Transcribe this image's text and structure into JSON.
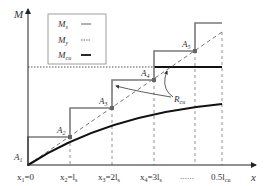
{
  "axes": {
    "y_label": "M",
    "x_label": "x"
  },
  "legend": {
    "items": [
      {
        "label": "M",
        "sub": "s",
        "style": "solid-thin"
      },
      {
        "label": "M",
        "sub": "y",
        "style": "dotted"
      },
      {
        "label": "M",
        "sub": "cu",
        "style": "solid-thick"
      }
    ]
  },
  "points": [
    {
      "label": "A",
      "sub": "1"
    },
    {
      "label": "A",
      "sub": "2"
    },
    {
      "label": "A",
      "sub": "3"
    },
    {
      "label": "A",
      "sub": "4"
    },
    {
      "label": "A",
      "sub": "5"
    }
  ],
  "annotation": {
    "label": "R",
    "sub": "cu"
  },
  "x_ticks": [
    {
      "pre": "x",
      "sub": "1",
      "post": "=0"
    },
    {
      "pre": "x",
      "sub": "2",
      "post": "=l",
      "post_sub": "s"
    },
    {
      "pre": "x",
      "sub": "3",
      "post": "=2l",
      "post_sub": "s"
    },
    {
      "pre": "x",
      "sub": "4",
      "post": "=3l",
      "post_sub": "s"
    },
    {
      "pre": "",
      "sub": "",
      "post": "……"
    },
    {
      "pre": "0.5l",
      "sub": "cu",
      "post": ""
    }
  ],
  "colors": {
    "step": "#7a7a7a",
    "curve": "#111111",
    "dashed": "#666666",
    "axis": "#222222"
  }
}
